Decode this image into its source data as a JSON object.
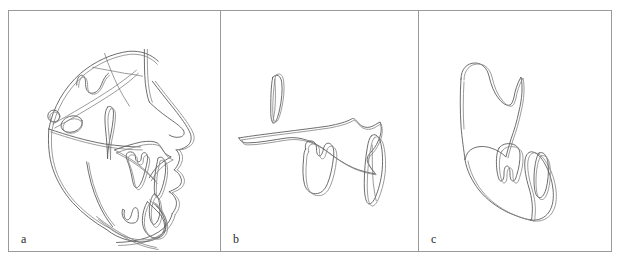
{
  "figure": {
    "kind": "cephalometric-tracing-figure",
    "background_color": "#ffffff",
    "frame_border_color": "#9a9a9a",
    "trace_line_color": "#5c5c5c",
    "trace_line_color_secondary": "#8a8a8a",
    "panel_count": 3
  },
  "panels": [
    {
      "label": "a",
      "name": "panel-a-full-skull-superimposition",
      "content_description": "Lateral cephalometric tracing of the full craniofacial profile with two superimposed outlines",
      "structures": [
        "cranial-base",
        "sella-turcica",
        "nasion",
        "frontal-bone",
        "orbit",
        "nasal-profile",
        "soft-tissue-profile",
        "upper-lip",
        "lower-lip",
        "chin",
        "maxilla",
        "mandible",
        "upper-incisor",
        "lower-incisor",
        "upper-molar",
        "lower-molar",
        "pterygomaxillary-fissure",
        "porion-circle"
      ]
    },
    {
      "label": "b",
      "name": "panel-b-maxillary-superimposition",
      "content_description": "Maxillary regional superimposition showing maxilla outline with upper incisor and upper molar",
      "structures": [
        "maxilla",
        "anterior-nasal-spine",
        "posterior-nasal-spine",
        "pterygoid-plate",
        "upper-incisor",
        "upper-molar"
      ]
    },
    {
      "label": "c",
      "name": "panel-c-mandibular-superimposition",
      "content_description": "Mandibular regional superimposition showing mandible outline with lower incisor and lower molar",
      "structures": [
        "mandible",
        "condyle",
        "coronoid-process",
        "sigmoid-notch",
        "ramus",
        "gonial-angle",
        "mandibular-body",
        "symphysis",
        "lower-incisor",
        "lower-molar"
      ]
    }
  ]
}
